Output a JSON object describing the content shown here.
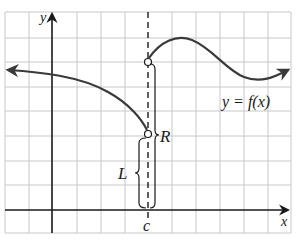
{
  "diagram": {
    "type": "function-graph-jump-discontinuity",
    "labels": {
      "y_axis": "y",
      "x_axis": "x",
      "c_point": "c",
      "left_limit": "L",
      "right_limit": "R",
      "function": "y = f(x)"
    },
    "elements": {
      "left_branch": "curve from left arrow decreasing to open circle at (c, L)",
      "right_branch": "curve from open circle at (c, R) rising to local max, dipping to local min, then rising with right arrow",
      "dashed_line": "vertical dashed line at x = c",
      "open_circles": [
        "(c, L)",
        "(c, R)"
      ],
      "braces": [
        "L brace from x-axis to left limit",
        "R brace from x-axis to right limit"
      ]
    },
    "colors": {
      "grid": "#c8c8c8",
      "axis": "#1a1a1a",
      "curve": "#3a3a3a"
    }
  }
}
